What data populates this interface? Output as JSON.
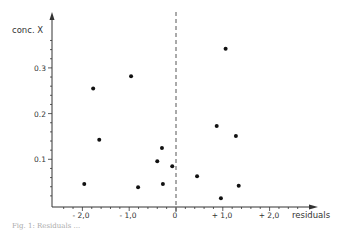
{
  "chart_data": {
    "type": "scatter",
    "title": "",
    "xlabel": "residuals",
    "ylabel": "conc. X",
    "xlim": [
      -2.5,
      2.6
    ],
    "ylim": [
      0,
      0.38
    ],
    "grid": false,
    "legend": null,
    "x_ticks": [
      -2.0,
      -1.0,
      0,
      1.0,
      2.0
    ],
    "x_tick_labels": [
      "- 2,0",
      "- 1,0",
      "0",
      "+ 1,0",
      "+ 2,0"
    ],
    "y_ticks": [
      0.1,
      0.2,
      0.3
    ],
    "y_tick_labels": [
      "0.1",
      "0.2",
      "0.3"
    ],
    "reference_line": {
      "x": 0,
      "style": "dashed"
    },
    "points": [
      {
        "x": -1.96,
        "y": 0.046
      },
      {
        "x": -1.64,
        "y": 0.143
      },
      {
        "x": -1.77,
        "y": 0.255
      },
      {
        "x": -0.96,
        "y": 0.282
      },
      {
        "x": -0.81,
        "y": 0.039
      },
      {
        "x": -0.4,
        "y": 0.096
      },
      {
        "x": -0.3,
        "y": 0.125
      },
      {
        "x": -0.28,
        "y": 0.046
      },
      {
        "x": -0.08,
        "y": 0.085
      },
      {
        "x": 0.45,
        "y": 0.063
      },
      {
        "x": 0.87,
        "y": 0.173
      },
      {
        "x": 0.96,
        "y": 0.015
      },
      {
        "x": 1.06,
        "y": 0.342
      },
      {
        "x": 1.28,
        "y": 0.151
      },
      {
        "x": 1.34,
        "y": 0.042
      }
    ]
  },
  "labels": {
    "ylabel": "conc. X",
    "xlabel": "residuals",
    "y_ticks": [
      "0.3",
      "0.2",
      "0.1"
    ],
    "x_ticks": [
      "- 2,0",
      "- 1,0",
      "0",
      "+ 1,0",
      "+ 2,0"
    ]
  },
  "caption": "Fig. 1: Residuals ..."
}
